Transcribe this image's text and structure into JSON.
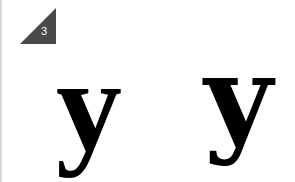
{
  "badge": {
    "number": "3",
    "color": "#4a4a4a"
  },
  "glyphs": [
    {
      "character": "y",
      "style": "serif with ball terminal"
    },
    {
      "character": "y",
      "style": "serif with straight tail and foot serif"
    }
  ]
}
